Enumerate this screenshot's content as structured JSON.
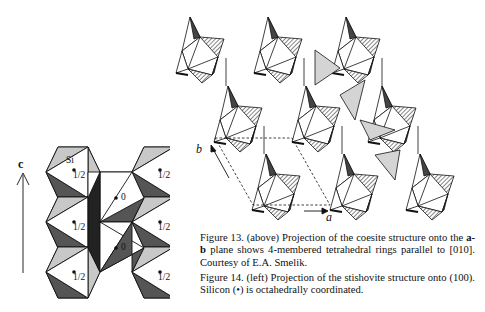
{
  "figure13": {
    "axes": {
      "a": "a",
      "b": "b"
    },
    "caption_prefix": "Figure 13. (above) Projection of the coesite structure onto the ",
    "caption_bold": "a-b",
    "caption_suffix": " plane shows 4-membered tetrahedral rings parallel to [010].  Courtesy of E.A. Smelik."
  },
  "figure14": {
    "axis": "c",
    "site_label": "Si",
    "heights": [
      "1/2",
      "1/2",
      "1/2",
      "0",
      "0",
      "1/2",
      "1/2",
      "1/2"
    ],
    "caption": "Figure 14. (left) Projection of the stishovite structure onto (100).  Silicon (•) is octahedrally coordinated."
  },
  "colors": {
    "light_gray": "#c8c8c8",
    "dark_gray": "#555555",
    "hatch": "#8a8a8a",
    "line": "#111111"
  }
}
